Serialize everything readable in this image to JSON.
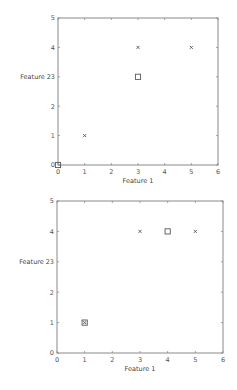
{
  "chart_data": [
    {
      "type": "scatter",
      "title": "",
      "xlabel": "Feature 1",
      "ylabel": "Feature 2",
      "xlim": [
        0,
        6
      ],
      "ylim": [
        0,
        5
      ],
      "xticks": [
        0,
        1,
        2,
        3,
        4,
        5,
        6
      ],
      "yticks": [
        0,
        1,
        2,
        3,
        4,
        5
      ],
      "grid": false,
      "series": [
        {
          "name": "points",
          "marker": "x",
          "x": [
            1,
            3,
            5
          ],
          "y": [
            1,
            4,
            4
          ]
        },
        {
          "name": "centroids",
          "marker": "square",
          "x": [
            0,
            3
          ],
          "y": [
            0,
            3
          ]
        }
      ],
      "box": {
        "left": 58,
        "top": 18,
        "right": 218,
        "bottom": 165
      }
    },
    {
      "type": "scatter",
      "title": "",
      "xlabel": "Feature 1",
      "ylabel": "Feature 2",
      "xlim": [
        0,
        6
      ],
      "ylim": [
        0,
        5
      ],
      "xticks": [
        0,
        1,
        2,
        3,
        4,
        5,
        6
      ],
      "yticks": [
        0,
        1,
        2,
        3,
        4,
        5
      ],
      "grid": false,
      "series": [
        {
          "name": "points",
          "marker": "x",
          "x": [
            1,
            3,
            5
          ],
          "y": [
            1,
            4,
            4
          ]
        },
        {
          "name": "centroids",
          "marker": "square",
          "x": [
            1,
            4
          ],
          "y": [
            1,
            4
          ]
        }
      ],
      "box": {
        "left": 57,
        "top": 201,
        "right": 223,
        "bottom": 353
      }
    }
  ]
}
